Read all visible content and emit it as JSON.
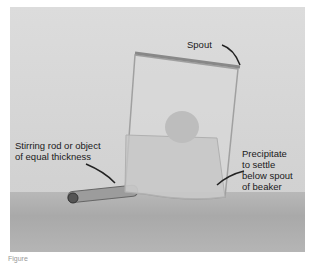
{
  "figure": {
    "labels": {
      "spout": "Spout",
      "stirring_rod": "Stirring rod or object\nof equal thickness",
      "precipitate": "Precipitate\nto settle\nbelow spout\nof beaker"
    },
    "beaker_markings": [
      "100",
      "50",
      "200"
    ],
    "caption": "Figure"
  }
}
